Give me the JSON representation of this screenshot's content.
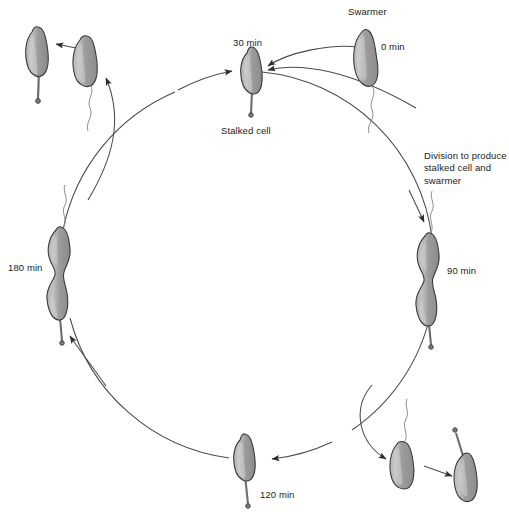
{
  "diagram": {
    "type": "cyclic-process-diagram",
    "organism_stage_colors": {
      "cell_body_fill": "#9a9a9a",
      "cell_body_highlight": "#c9c9c9",
      "cell_outline": "#3a3a3a",
      "stalk": "#6e6e6e",
      "flagellum": "#8a8a8a",
      "arrow": "#333333",
      "cycle_ring": "#4a4a4a",
      "text": "#1b1b1b",
      "background": "#ffffff"
    },
    "cycle": {
      "center_x": 250,
      "center_y": 266,
      "radius": 190
    },
    "labels": [
      {
        "id": "swarmer",
        "text": "Swarmer",
        "x": 348,
        "y": 6,
        "block": false
      },
      {
        "id": "t0",
        "text": "0 min",
        "x": 381,
        "y": 41,
        "block": false
      },
      {
        "id": "t30",
        "text": "30 min",
        "x": 233,
        "y": 37,
        "block": false
      },
      {
        "id": "stalked-cell",
        "text": "Stalked cell",
        "x": 221,
        "y": 125,
        "block": false
      },
      {
        "id": "division-note",
        "text": "Division to produce stalked cell and swarmer",
        "x": 424,
        "y": 150,
        "block": true
      },
      {
        "id": "t90",
        "text": "90 min",
        "x": 447,
        "y": 265,
        "block": false
      },
      {
        "id": "t180",
        "text": "180 min",
        "x": 8,
        "y": 262,
        "block": false
      },
      {
        "id": "t120",
        "text": "120 min",
        "x": 260,
        "y": 489,
        "block": false
      }
    ],
    "stages": [
      {
        "id": "swarmer-0min",
        "label": "Swarmer at 0 min",
        "position": "top-right",
        "has_flagellum": true,
        "has_stalk": false,
        "dividing": false
      },
      {
        "id": "stalked-30min",
        "label": "Stalked cell at 30 min",
        "position": "top-center",
        "has_flagellum": false,
        "has_stalk": true,
        "dividing": false
      },
      {
        "id": "dividing-90min",
        "label": "Dividing cell at 90 min",
        "position": "right",
        "has_flagellum": true,
        "has_stalk": true,
        "dividing": true
      },
      {
        "id": "swarmer-release",
        "label": "Released swarmer cell",
        "position": "bottom-right",
        "has_flagellum": true,
        "has_stalk": false,
        "dividing": false
      },
      {
        "id": "stalked-progeny",
        "label": "Stalked progeny cell",
        "position": "bottom-right-far",
        "has_flagellum": false,
        "has_stalk": true,
        "dividing": false
      },
      {
        "id": "stalked-120min",
        "label": "Stalked cell at 120 min",
        "position": "bottom-center",
        "has_flagellum": false,
        "has_stalk": true,
        "dividing": false
      },
      {
        "id": "dividing-180min",
        "label": "Dividing cell at 180 min",
        "position": "left",
        "has_flagellum": true,
        "has_stalk": true,
        "dividing": true
      },
      {
        "id": "swarmer-progeny",
        "label": "Swarmer progeny cell",
        "position": "top-left-inner",
        "has_flagellum": true,
        "has_stalk": false,
        "dividing": false
      },
      {
        "id": "stalked-progeny-topleft",
        "label": "Stalked progeny cell (top left)",
        "position": "top-left",
        "has_flagellum": false,
        "has_stalk": true,
        "dividing": false
      }
    ]
  }
}
